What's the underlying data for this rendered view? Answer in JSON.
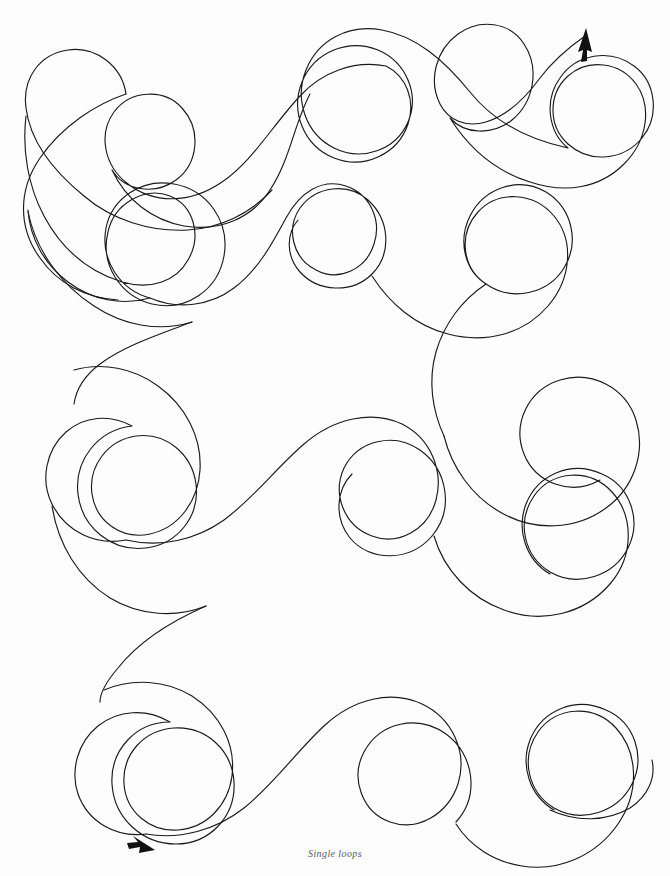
{
  "page": {
    "width": 670,
    "height": 876,
    "background_color": "#fdfdfd",
    "title": "Single loops"
  },
  "caption": {
    "text": "Single loops",
    "color": "#5b5b5b",
    "align": "center"
  },
  "drawing": {
    "name": "single-loops-practice-stroke",
    "description": "Continuous single-stroke cursive loop practice line",
    "stroke_color": "#1a1a1a",
    "stroke_width": 1.15,
    "fill": "none",
    "loop_count": 16,
    "row_count": 4,
    "arrow_color": "#111111",
    "start_arrow": {
      "name": "start-arrowhead",
      "x": 148,
      "y": 846,
      "direction": "down-right",
      "angle_deg": 36
    },
    "end_arrow": {
      "name": "end-arrowhead",
      "x": 584,
      "y": 31,
      "direction": "up-right",
      "angle_deg": -72
    },
    "path": "M 150 844 C 138 836 124 816 118 796 C 110 768 112 736 128 714 C 146 690 180 682 202 700 C 222 716 222 746 206 766 C 188 788 156 794 132 780 C 106 764 92 734 96 708 C 100 676 124 652 154 646 C 182 640 206 656 214 680 C 222 706 210 734 188 750 C 164 768 132 772 112 758 C 96 746 88 726 92 708 C 98 684 120 670 144 670 C 172 670 194 690 200 716 C 206 744 196 772 176 788 C 158 802 138 804 124 796 C 146 810 176 812 204 800 C 236 786 260 758 278 726 C 296 694 312 668 336 700 C 354 724 350 756 332 778 C 312 802 276 808 254 790 C 232 772 230 740 246 718 C 264 694 300 688 324 706 C 350 726 358 762 346 792 C 336 818 310 834 284 830 C 262 826 246 810 242 790 C 312 822 390 806 436 758 C 470 722 486 680 496 640 C 510 584 532 540 572 520 C 608 502 642 518 650 552 C 658 586 640 622 608 636 C 574 650 538 638 522 610 C 506 582 512 548 534 528 C 558 506 594 508 614 532 C 634 556 632 592 610 614 C 588 636 552 636 532 614 C 514 594 516 564 534 548 C 488 574 452 612 430 656 C 404 708 386 756 352 782 C 316 810 276 806 248 776 C 226 752 220 718 230 688 C 240 656 264 634 292 628 C 326 620 356 640 364 672 C 372 706 356 740 328 754 C 298 768 266 758 250 732 C 234 706 240 672 264 654 C 290 634 326 640 344 666 C 362 692 356 728 332 746 C 306 766 268 760 250 734 C 236 712 238 684 256 668 C 220 694 192 732 178 774 C 166 808 146 832 120 842 C 106 848 94 846 88 838 C 106 818 128 802 150 792 C 184 776 218 756 240 726 C 262 696 276 662 296 632 C 318 598 348 578 382 580 C 414 582 438 606 440 638 C 442 672 420 700 390 708 C 358 716 328 698 318 668 C 308 638 322 604 350 590 C 380 574 416 586 432 616 C 448 646 438 684 410 702 C 384 718 350 712 332 686 C 316 664 320 634 340 618 C 296 640 262 678 242 724 C 224 764 198 792 164 800 C 138 806 116 796 108 776 C 100 754 112 730 134 722 C 158 712 184 724 192 748 C 200 774 186 802 162 812 C 196 812 228 796 252 770 C 286 734 308 690 338 658 C 372 622 412 608 452 622 C 486 634 506 666 500 700 C 494 734 464 756 432 750 C 400 744 380 714 386 682 C 392 648 424 626 458 632 C 494 638 518 672 512 708 C 506 746 470 770 434 762 C 404 756 384 730 388 702 C 350 730 326 772 306 814 C 290 848 266 872 236 876 C 210 880 188 866 184 842 C 180 818 196 796 220 792 C 246 788 270 806 274 832 C 290 806 296 776 304 746 C 316 702 336 662 370 636 C 406 608 450 606 484 630 C 514 652 526 692 516 728 C 506 764 472 788 436 782 C 404 776 382 748 386 716 C 334 748 302 800 284 856 C 272 894 246 920 214 920"
  },
  "colors": {
    "background": "#fdfdfd",
    "stroke": "#1a1a1a",
    "caption": "#5b5b5b",
    "arrow": "#111111"
  }
}
